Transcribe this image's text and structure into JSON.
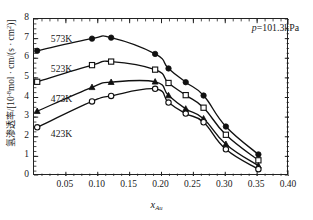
{
  "chart_data": {
    "type": "line",
    "title": "",
    "xlabel": "x_Au",
    "xlabel_main": "x",
    "xlabel_sub": "Au",
    "ylabel_cjk": "氢渗透率",
    "ylabel_unit": "/[10-8mol · cm/(s · cm2)]",
    "xlim": [
      0.0,
      0.4
    ],
    "ylim": [
      0,
      8
    ],
    "xticks": [
      "0.05",
      "0.10",
      "0.15",
      "0.20",
      "0.25",
      "0.30",
      "0.35",
      "0.40"
    ],
    "xtick_values": [
      0.05,
      0.1,
      0.15,
      0.2,
      0.25,
      0.3,
      0.35,
      0.4
    ],
    "yticks": [
      "0",
      "1",
      "2",
      "3",
      "4",
      "5",
      "6",
      "7",
      "8"
    ],
    "ytick_values": [
      0,
      1,
      2,
      3,
      4,
      5,
      6,
      7,
      8
    ],
    "xminor_step": 0.0125,
    "yminor_step": 0.25,
    "grid": false,
    "legend_position": "inline-labels",
    "annotations": [
      {
        "text": "p=101.3kPa",
        "italic_prefix": "p",
        "rest": "=101.3kPa",
        "x": 0.315,
        "y": 7.45
      }
    ],
    "series": [
      {
        "name": "573K",
        "label": "573K",
        "marker": "filled-circle",
        "label_x": 0.028,
        "label_y": 6.95,
        "x": [
          0.005,
          0.091,
          0.121,
          0.19,
          0.211,
          0.238,
          0.266,
          0.301,
          0.352
        ],
        "y": [
          6.38,
          7.0,
          7.05,
          6.22,
          5.48,
          4.78,
          4.1,
          2.52,
          1.1
        ]
      },
      {
        "name": "523K",
        "label": "523K",
        "marker": "open-square",
        "label_x": 0.028,
        "label_y": 5.4,
        "x": [
          0.005,
          0.091,
          0.121,
          0.19,
          0.211,
          0.238,
          0.266,
          0.301,
          0.352
        ],
        "y": [
          4.8,
          5.65,
          5.83,
          5.42,
          4.74,
          4.12,
          3.48,
          2.1,
          0.8
        ]
      },
      {
        "name": "473K",
        "label": "473K",
        "marker": "filled-triangle",
        "label_x": 0.028,
        "label_y": 3.85,
        "x": [
          0.005,
          0.091,
          0.121,
          0.19,
          0.211,
          0.238,
          0.266,
          0.301,
          0.352
        ],
        "y": [
          3.3,
          4.52,
          4.78,
          4.8,
          4.1,
          3.42,
          2.92,
          1.62,
          0.52
        ]
      },
      {
        "name": "423K",
        "label": "423K",
        "marker": "open-circle",
        "label_x": 0.028,
        "label_y": 2.1,
        "x": [
          0.005,
          0.091,
          0.121,
          0.19,
          0.211,
          0.238,
          0.266,
          0.301,
          0.352
        ],
        "y": [
          2.48,
          3.8,
          4.08,
          4.44,
          3.74,
          3.18,
          2.74,
          1.36,
          0.35
        ]
      }
    ]
  },
  "colors": {
    "line": "#111111",
    "axis": "#222222",
    "background": "#ffffff"
  }
}
